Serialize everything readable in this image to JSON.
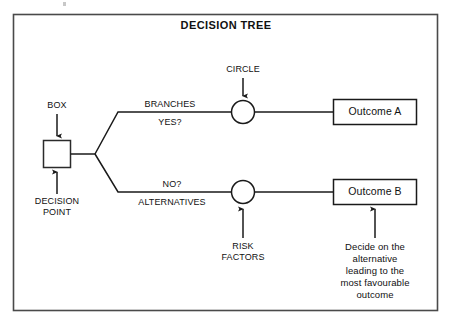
{
  "diagram": {
    "title": "DECISION TREE",
    "type": "decision-tree",
    "frame": {
      "stroke": "#4a4a4a",
      "fill": "#ffffff"
    },
    "line_color": "#1a1a1a",
    "nodes": [
      {
        "id": "decision-point",
        "shape": "square",
        "label": "",
        "annotations": [
          "BOX",
          "DECISION\nPOINT"
        ]
      },
      {
        "id": "chance-node-top",
        "shape": "circle",
        "label": "",
        "annotations": [
          "CIRCLE"
        ]
      },
      {
        "id": "chance-node-bottom",
        "shape": "circle",
        "label": "",
        "annotations": [
          "RISK\nFACTORS"
        ]
      },
      {
        "id": "outcome-a",
        "shape": "rect",
        "label": "Outcome A"
      },
      {
        "id": "outcome-b",
        "shape": "rect",
        "label": "Outcome B"
      }
    ]
  },
  "labels": {
    "box": "BOX",
    "decision_point_line1": "DECISION",
    "decision_point_line2": "POINT",
    "circle": "CIRCLE",
    "branches": "BRANCHES",
    "yes": "YES?",
    "no": "NO?",
    "alternatives": "ALTERNATIVES",
    "risk_line1": "RISK",
    "risk_line2": "FACTORS"
  },
  "outcomes": {
    "a": "Outcome A",
    "b": "Outcome B"
  },
  "caption": {
    "line1": "Decide on the",
    "line2": "alternative",
    "line3": "leading to the",
    "line4": "most favourable",
    "line5": "outcome"
  }
}
